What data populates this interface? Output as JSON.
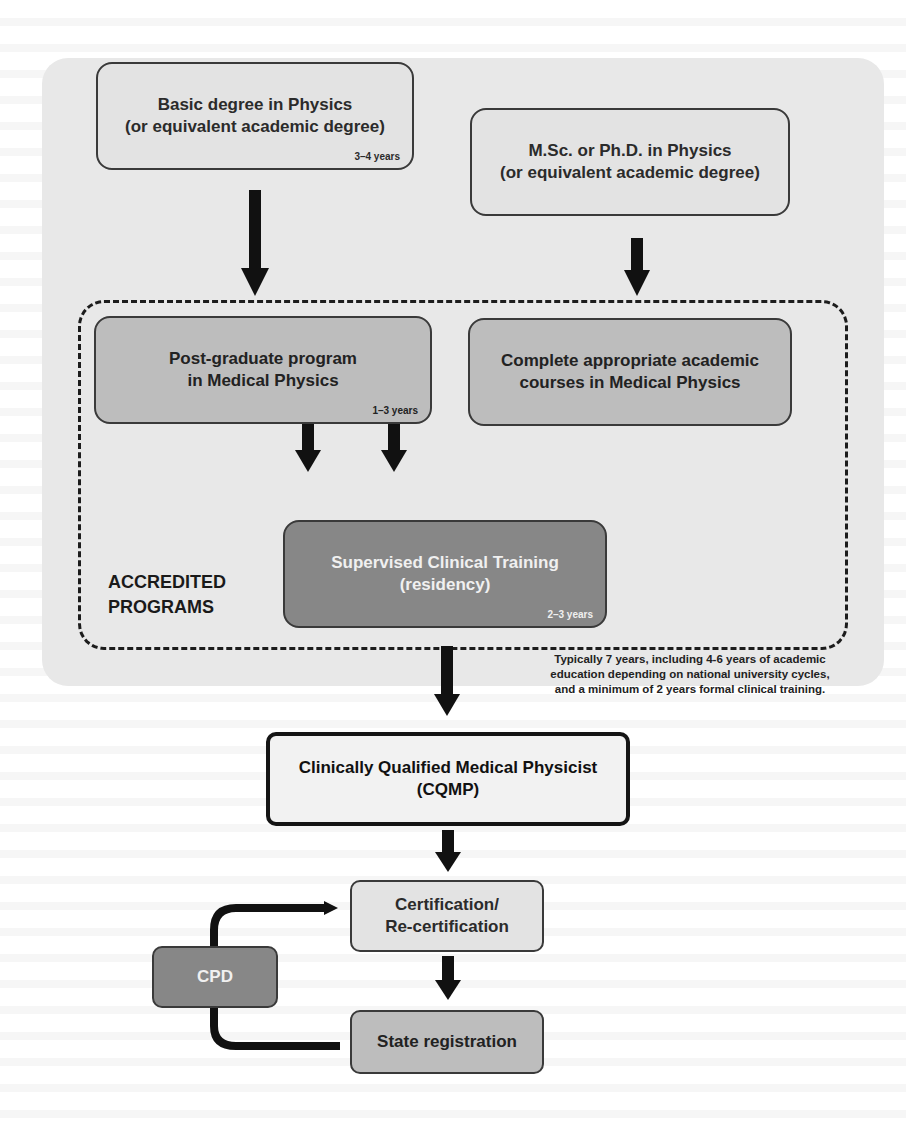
{
  "diagram": {
    "boxes": {
      "basic_degree": {
        "title_line1": "Basic degree in Physics",
        "title_line2": "(or equivalent academic degree)",
        "duration": "3–4 years"
      },
      "msc_phd": {
        "title_line1": "M.Sc. or Ph.D. in Physics",
        "title_line2": "(or equivalent academic degree)"
      },
      "postgrad": {
        "title_line1": "Post-graduate program",
        "title_line2": "in Medical Physics",
        "duration": "1–3 years"
      },
      "courses": {
        "title_line1": "Complete appropriate academic",
        "title_line2": "courses in Medical Physics"
      },
      "residency": {
        "title_line1": "Supervised Clinical Training",
        "title_line2": "(residency)",
        "duration": "2–3 years"
      },
      "cqmp": {
        "title_line1": "Clinically Qualified Medical Physicist",
        "title_line2": "(CQMP)"
      },
      "certification": {
        "title_line1": "Certification/",
        "title_line2": "Re-certification"
      },
      "state_registration": {
        "title_line1": "State registration"
      },
      "cpd": {
        "title_line1": "CPD"
      }
    },
    "frame_label": {
      "line1": "ACCREDITED",
      "line2": "PROGRAMS"
    },
    "note": {
      "line1": "Typically 7 years, including 4-6 years of academic",
      "line2": "education depending on national university cycles,",
      "line3": "and a minimum of 2 years formal clinical training."
    },
    "colors": {
      "panel": "#e8e8e8",
      "light_box": "#e3e3e3",
      "mid_box": "#bdbdbd",
      "dark_box": "#878787",
      "arrow": "#111111"
    }
  }
}
